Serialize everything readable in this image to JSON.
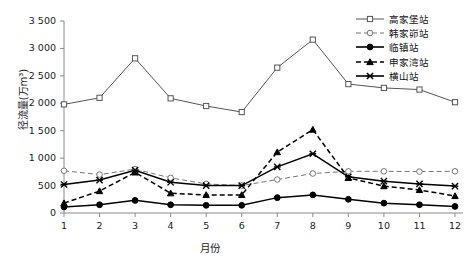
{
  "chart_data": {
    "type": "line",
    "title": "",
    "xlabel": "月份",
    "ylabel": "径流量(万m³)",
    "categories": [
      "1",
      "2",
      "3",
      "4",
      "5",
      "6",
      "7",
      "8",
      "9",
      "10",
      "11",
      "12"
    ],
    "x": [
      1,
      2,
      3,
      4,
      5,
      6,
      7,
      8,
      9,
      10,
      11,
      12
    ],
    "xlim": [
      1,
      12
    ],
    "ylim": [
      0,
      3500
    ],
    "yticks": [
      0,
      500,
      1000,
      1500,
      2000,
      2500,
      3000,
      3500
    ],
    "ytick_labels": [
      "0",
      "500",
      "1 000",
      "1 500",
      "2 000",
      "2 500",
      "3 000",
      "3 500"
    ],
    "grid": false,
    "legend_position": "top-right",
    "series": [
      {
        "name": "高家堡站",
        "marker": "open-square",
        "line": "solid",
        "color": "#555555",
        "values": [
          1980,
          2100,
          2820,
          2090,
          1950,
          1840,
          2650,
          3160,
          2350,
          2280,
          2250,
          2020
        ]
      },
      {
        "name": "韩家峁站",
        "marker": "open-circle",
        "line": "dashed",
        "color": "#777777",
        "values": [
          770,
          700,
          800,
          640,
          530,
          500,
          610,
          720,
          760,
          760,
          755,
          760
        ]
      },
      {
        "name": "临镇站",
        "marker": "filled-circle",
        "line": "solid",
        "color": "#000000",
        "values": [
          110,
          150,
          230,
          150,
          140,
          140,
          280,
          330,
          250,
          180,
          150,
          120
        ]
      },
      {
        "name": "申家湾站",
        "marker": "filled-triangle",
        "line": "dashed",
        "color": "#000000",
        "values": [
          180,
          400,
          740,
          360,
          330,
          330,
          1110,
          1520,
          640,
          490,
          420,
          310
        ]
      },
      {
        "name": "横山站",
        "marker": "cross-x",
        "line": "solid",
        "color": "#000000",
        "values": [
          520,
          600,
          780,
          560,
          500,
          500,
          840,
          1080,
          660,
          580,
          530,
          490
        ]
      }
    ]
  }
}
